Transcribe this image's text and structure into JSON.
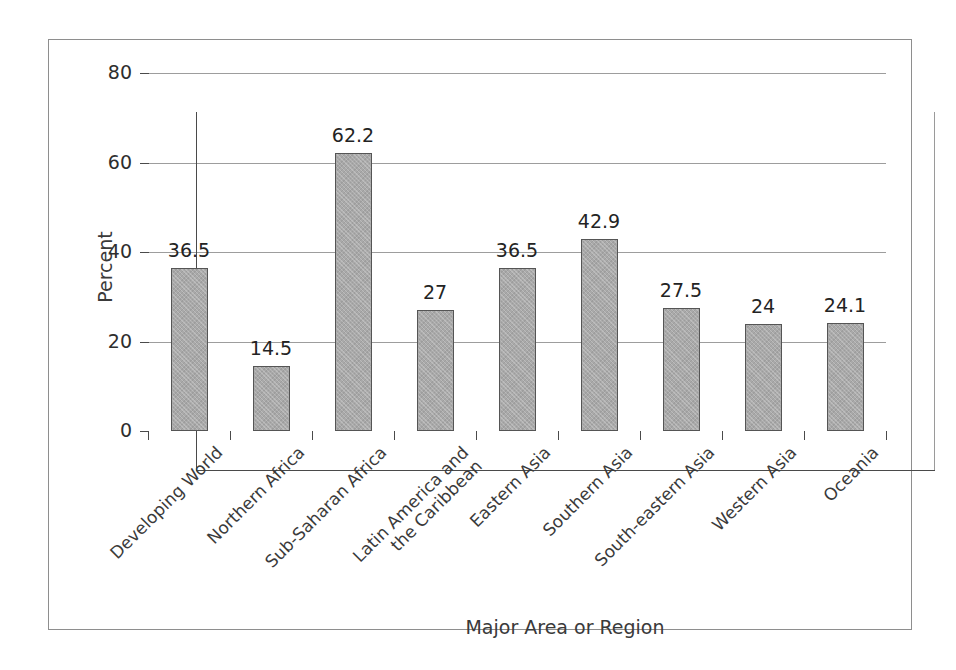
{
  "chart_data": {
    "type": "bar",
    "title": "",
    "xlabel": "Major Area or Region",
    "ylabel": "Percent",
    "ylim": [
      0,
      80
    ],
    "yticks": [
      0,
      20,
      40,
      60,
      80
    ],
    "ytick_labels": [
      "0",
      "20",
      "40",
      "60",
      "80"
    ],
    "grid": true,
    "legend": "none",
    "label_rotation_deg": -45,
    "bar_color": "#a9a9a9",
    "bar_edge_color": "#555555",
    "categories": [
      "Developing World",
      "Northern Africa",
      "Sub-Saharan Africa",
      "Latin America and the Caribbean",
      "Eastern Asia",
      "Southern Asia",
      "South-eastern Asia",
      "Western Asia",
      "Oceania"
    ],
    "category_lines": [
      [
        "Developing World"
      ],
      [
        "Northern Africa"
      ],
      [
        "Sub-Saharan Africa"
      ],
      [
        "Latin America and",
        "the Caribbean"
      ],
      [
        "Eastern Asia"
      ],
      [
        "Southern Asia"
      ],
      [
        "South-eastern Asia"
      ],
      [
        "Western Asia"
      ],
      [
        "Oceania"
      ]
    ],
    "values": [
      36.5,
      14.5,
      62.2,
      27,
      36.5,
      42.9,
      27.5,
      24,
      24.1
    ],
    "value_labels": [
      "36.5",
      "14.5",
      "62.2",
      "27",
      "36.5",
      "42.9",
      "27.5",
      "24",
      "24.1"
    ]
  }
}
